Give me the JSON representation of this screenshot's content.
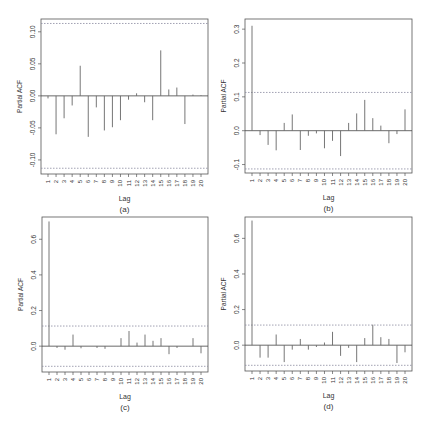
{
  "figure": {
    "panels_layout": "2x2"
  },
  "chart_data": [
    {
      "type": "bar",
      "panel_label": "(a)",
      "title": "",
      "xlabel": "Lag",
      "ylabel": "Partial ACF",
      "x": [
        1,
        2,
        3,
        4,
        5,
        6,
        7,
        8,
        9,
        10,
        11,
        12,
        13,
        14,
        15,
        16,
        17,
        18,
        19,
        20
      ],
      "values": [
        -0.004,
        -0.06,
        -0.035,
        -0.015,
        0.047,
        -0.064,
        -0.018,
        -0.054,
        -0.049,
        -0.038,
        -0.006,
        0.004,
        -0.01,
        -0.038,
        0.071,
        0.01,
        0.013,
        -0.044,
        0.002,
        0.001
      ],
      "ylim": [
        -0.122,
        0.12
      ],
      "yticks": [
        -0.1,
        -0.05,
        0.0,
        0.05,
        0.1
      ],
      "ytick_labels": [
        "-0.10",
        "-0.05",
        "0.00",
        "0.05",
        "0.10"
      ],
      "confidence_bounds": [
        -0.113,
        0.113
      ],
      "grid": false,
      "box": {
        "x0": 41,
        "y0": 19,
        "x1": 208,
        "y1": 174
      }
    },
    {
      "type": "bar",
      "panel_label": "(b)",
      "title": "",
      "xlabel": "Lag",
      "ylabel": "Partial ACF",
      "x": [
        1,
        2,
        3,
        4,
        5,
        6,
        7,
        8,
        9,
        10,
        11,
        12,
        13,
        14,
        15,
        16,
        17,
        18,
        19,
        20
      ],
      "values": [
        0.31,
        -0.013,
        -0.042,
        -0.058,
        0.023,
        0.048,
        -0.057,
        -0.015,
        -0.008,
        -0.052,
        -0.03,
        -0.075,
        0.023,
        0.051,
        0.091,
        0.037,
        0.015,
        -0.037,
        -0.01,
        0.063
      ],
      "ylim": [
        -0.125,
        0.33
      ],
      "yticks": [
        -0.1,
        0.0,
        0.1,
        0.2,
        0.3
      ],
      "ytick_labels": [
        "-0.1",
        "0.0",
        "0.1",
        "0.2",
        "0.3"
      ],
      "confidence_bounds": [
        -0.113,
        0.113
      ],
      "grid": false,
      "box": {
        "x0": 245,
        "y0": 19,
        "x1": 412,
        "y1": 173
      }
    },
    {
      "type": "bar",
      "panel_label": "(c)",
      "title": "",
      "xlabel": "Lag",
      "ylabel": "Partial ACF",
      "x": [
        1,
        2,
        3,
        4,
        5,
        6,
        7,
        8,
        9,
        10,
        11,
        12,
        13,
        14,
        15,
        16,
        17,
        18,
        19,
        20
      ],
      "values": [
        0.7,
        -0.01,
        -0.02,
        0.065,
        -0.012,
        0.0,
        -0.01,
        -0.015,
        0.0,
        0.045,
        0.085,
        0.02,
        0.065,
        0.03,
        0.045,
        -0.045,
        -0.01,
        0.0,
        0.045,
        -0.04
      ],
      "ylim": [
        -0.145,
        0.725
      ],
      "yticks": [
        0.0,
        0.2,
        0.4,
        0.6
      ],
      "ytick_labels": [
        "0.0",
        "0.2",
        "0.4",
        "0.6"
      ],
      "confidence_bounds": [
        -0.113,
        0.113
      ],
      "grid": false,
      "box": {
        "x0": 42,
        "y0": 217,
        "x1": 208,
        "y1": 372
      }
    },
    {
      "type": "bar",
      "panel_label": "(d)",
      "title": "",
      "xlabel": "Lag",
      "ylabel": "Partial ACF",
      "x": [
        1,
        2,
        3,
        4,
        5,
        6,
        7,
        8,
        9,
        10,
        11,
        12,
        13,
        14,
        15,
        16,
        17,
        18,
        19,
        20
      ],
      "values": [
        0.7,
        -0.07,
        -0.07,
        0.06,
        -0.095,
        -0.025,
        0.035,
        -0.025,
        -0.01,
        0.015,
        0.075,
        -0.06,
        -0.015,
        -0.095,
        0.04,
        0.115,
        0.045,
        0.035,
        -0.1,
        -0.04
      ],
      "ylim": [
        -0.145,
        0.72
      ],
      "yticks": [
        0.0,
        0.2,
        0.4,
        0.6
      ],
      "ytick_labels": [
        "0.0",
        "0.2",
        "0.4",
        "0.6"
      ],
      "confidence_bounds": [
        -0.113,
        0.113
      ],
      "grid": false,
      "box": {
        "x0": 245,
        "y0": 217,
        "x1": 412,
        "y1": 371
      }
    }
  ],
  "colors": {
    "axis": "#555555",
    "bar": "#666666",
    "zero_line": "#444444",
    "bound_line": "#8a8aa0",
    "text": "#333333"
  }
}
